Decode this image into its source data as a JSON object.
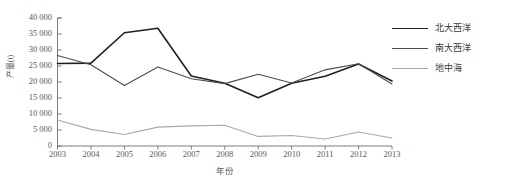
{
  "chart_data": {
    "type": "line",
    "title": "",
    "xlabel": "年份",
    "ylabel": "产量(t)",
    "categories": [
      "2003",
      "2004",
      "2005",
      "2006",
      "2007",
      "2008",
      "2009",
      "2010",
      "2011",
      "2012",
      "2013"
    ],
    "ylim": [
      0,
      40000
    ],
    "ytick_values": [
      0,
      5000,
      10000,
      15000,
      20000,
      25000,
      30000,
      35000,
      40000
    ],
    "ytick_labels": [
      "0",
      "5 000",
      "10 000",
      "15 000",
      "20 000",
      "25 000",
      "30 000",
      "35 000",
      "40 000"
    ],
    "grid": false,
    "legend_position": "right",
    "series": [
      {
        "name": "北大西洋",
        "color": "#231f20",
        "width": 1.6,
        "values": [
          25800,
          25900,
          35400,
          36800,
          21900,
          19600,
          15100,
          19600,
          21800,
          25600,
          20300
        ]
      },
      {
        "name": "南大西洋",
        "color": "#4d4d4f",
        "width": 1.1,
        "values": [
          28300,
          25400,
          18900,
          24700,
          21000,
          19500,
          22400,
          19700,
          23800,
          25700,
          19400
        ]
      },
      {
        "name": "地中海",
        "color": "#a7a9ac",
        "width": 1.1,
        "values": [
          8100,
          5200,
          3600,
          5900,
          6300,
          6500,
          3000,
          3300,
          2200,
          4400,
          2500
        ]
      }
    ]
  },
  "legend": {
    "items": [
      {
        "label": "北大西洋"
      },
      {
        "label": "南大西洋"
      },
      {
        "label": "地中海"
      }
    ]
  },
  "axes": {
    "x_title": "年份",
    "y_title": "产量(t)"
  }
}
